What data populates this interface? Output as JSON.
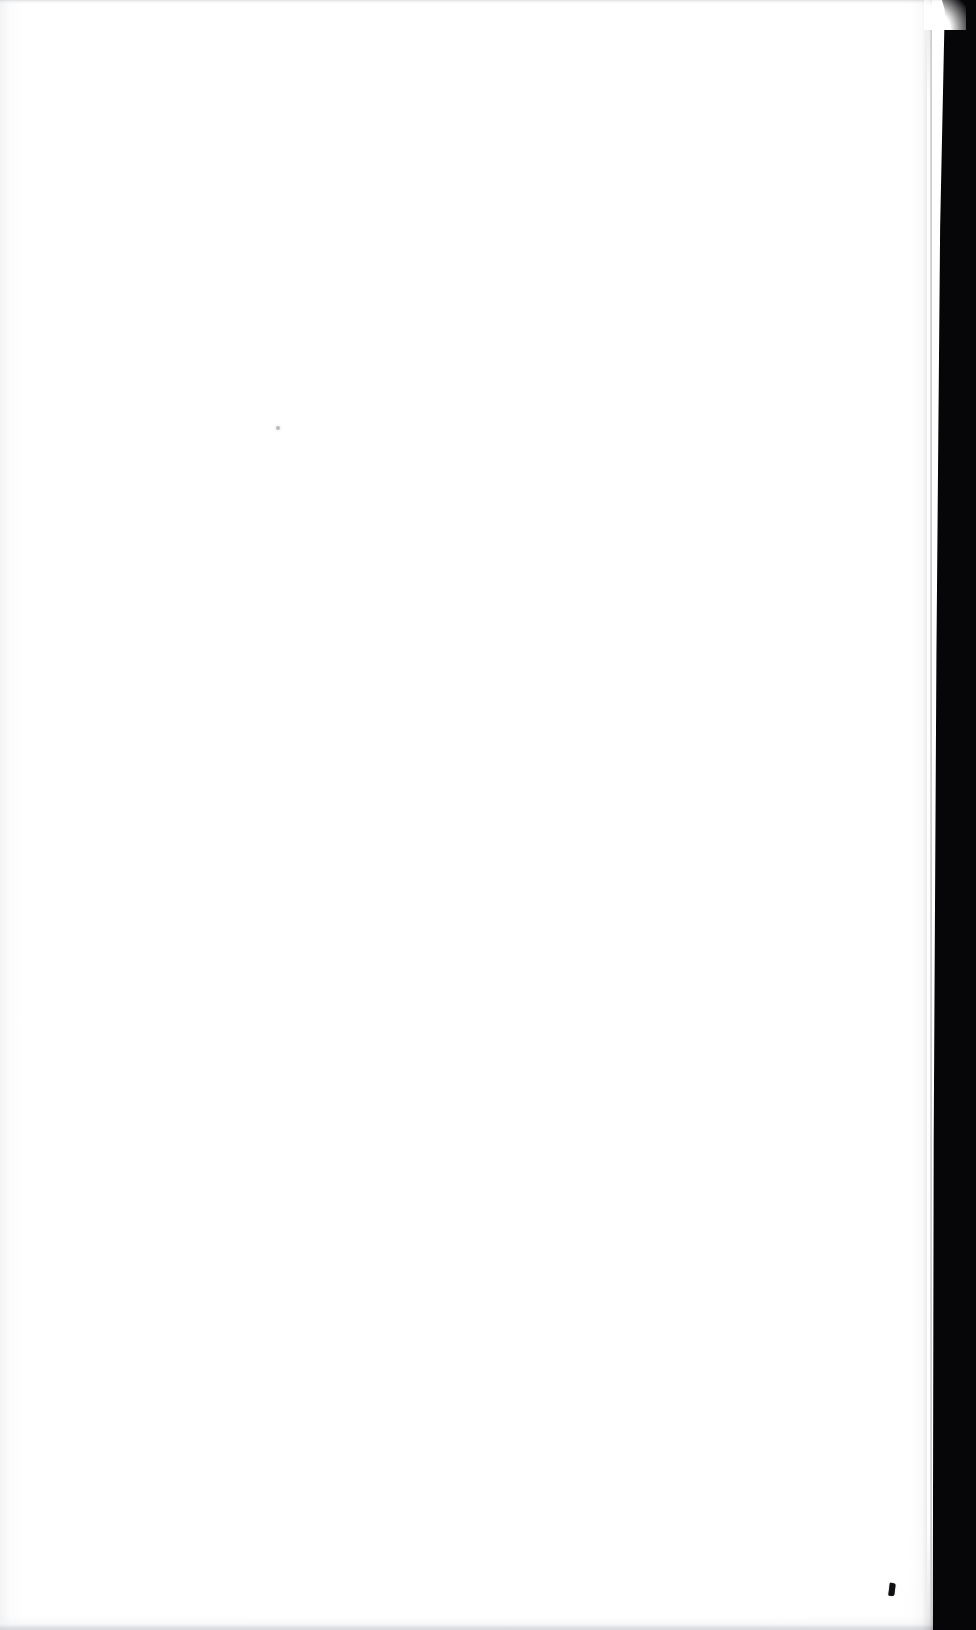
{
  "document": {
    "kind": "scanned-page",
    "page_content": "",
    "page_description": "Blank scanned page",
    "dimensions": {
      "width": 976,
      "height": 1630
    }
  },
  "colors": {
    "paper": "#ffffff",
    "paper_shade": "#fbfbfc",
    "gutter_shadow": "#060608",
    "ink_mark": "#101012",
    "speck": "#9ea0a8",
    "scan_band_top": "#c4c6ca",
    "scan_band_bottom": "#d6d8dc"
  },
  "artifacts": [
    {
      "name": "gutter-shadow",
      "description": "Dark vertical band along right edge (book gutter / page edge shadow)",
      "x": 945,
      "y": 0,
      "width": 31,
      "height": 1630
    },
    {
      "name": "ink-mark-bottom-right",
      "description": "Small dark ink mark near bottom right",
      "x": 889,
      "y": 1583,
      "width": 6,
      "height": 13
    },
    {
      "name": "speck-mid-left",
      "description": "Faint grey speck in the upper left quadrant",
      "x": 276,
      "y": 426,
      "width": 4,
      "height": 4
    },
    {
      "name": "top-scan-band",
      "description": "Faint light grey band across the top edge",
      "x": 0,
      "y": 0,
      "width": 976,
      "height": 4
    },
    {
      "name": "bottom-scan-band",
      "description": "Faint grey line near the bottom edge",
      "x": 0,
      "y": 1616,
      "width": 976,
      "height": 14
    }
  ]
}
